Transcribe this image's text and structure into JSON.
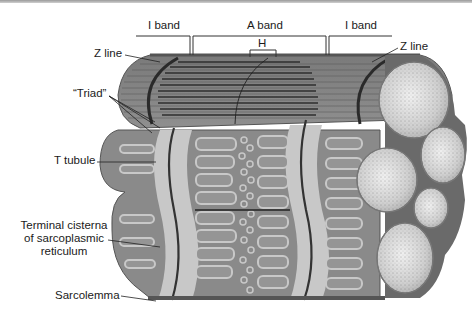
{
  "figure": {
    "colors": {
      "muscle_dark": "#6f6f6f",
      "muscle_mid": "#8e8e8e",
      "sr_light": "#c8c8c8",
      "myofibril_cross_section": "#d8d8d8",
      "leader_line": "#222222",
      "background": "#ffffff"
    }
  },
  "labels": {
    "i_band_left": "I band",
    "a_band": "A band",
    "i_band_right": "I band",
    "h_zone": "H",
    "z_line_left": "Z line",
    "z_line_right": "Z line",
    "triad": "“Triad”",
    "t_tubule": "T tubule",
    "terminal_cisterna_line1": "Terminal cisterna",
    "terminal_cisterna_line2": "of sarcoplasmic",
    "terminal_cisterna_line3": "reticulum",
    "sarcolemma": "Sarcolemma"
  }
}
